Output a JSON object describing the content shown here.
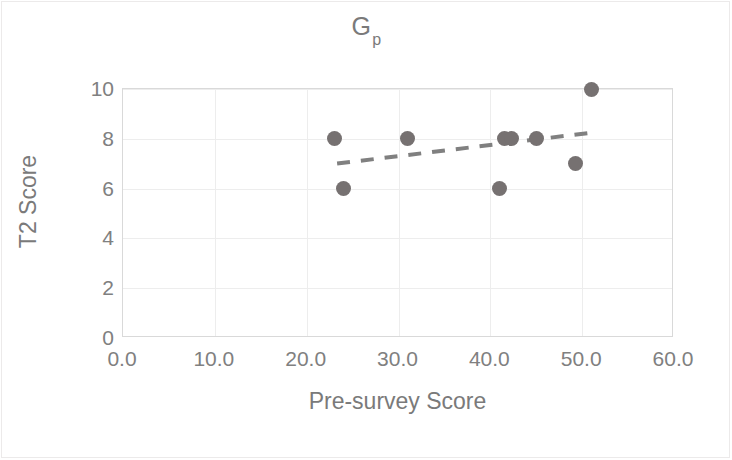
{
  "chart_data": {
    "type": "scatter",
    "title": "G",
    "title_subscript": "p",
    "xlabel": "Pre-survey Score",
    "ylabel": "T2 Score",
    "xlim": [
      0,
      60
    ],
    "ylim": [
      0,
      10
    ],
    "xticks": [
      "0.0",
      "10.0",
      "20.0",
      "30.0",
      "40.0",
      "50.0",
      "60.0"
    ],
    "xtick_values": [
      0,
      10,
      20,
      30,
      40,
      50,
      60
    ],
    "yticks": [
      "0",
      "2",
      "4",
      "6",
      "8",
      "10"
    ],
    "ytick_values": [
      0,
      2,
      4,
      6,
      8,
      10
    ],
    "grid": true,
    "legend": null,
    "marker_color": "#767171",
    "trendline_color": "#808080",
    "grid_color": "#ededed",
    "axis_color": "#d9d9d9",
    "text_color": "#7a7a7a",
    "points": [
      {
        "x": 23.0,
        "y": 8
      },
      {
        "x": 24.0,
        "y": 6
      },
      {
        "x": 31.0,
        "y": 8
      },
      {
        "x": 41.0,
        "y": 6
      },
      {
        "x": 41.5,
        "y": 8
      },
      {
        "x": 42.3,
        "y": 8
      },
      {
        "x": 45.0,
        "y": 8
      },
      {
        "x": 49.3,
        "y": 7
      },
      {
        "x": 51.0,
        "y": 10
      }
    ],
    "trendline": {
      "style": "dashed",
      "x0": 23.4,
      "y0": 6.98,
      "x1": 51.6,
      "y1": 8.25
    }
  }
}
